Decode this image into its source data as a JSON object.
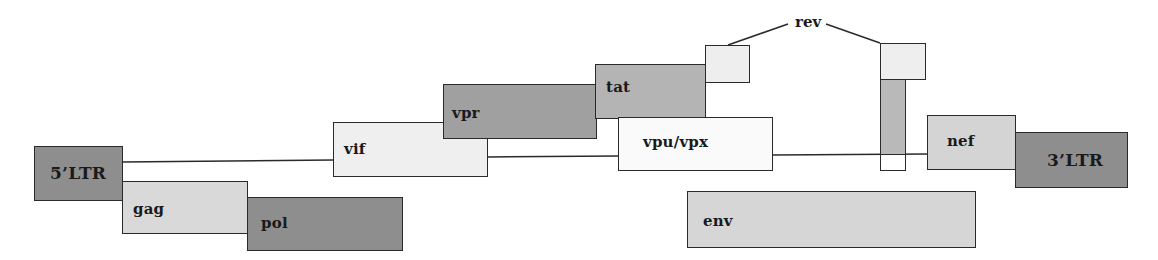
{
  "diagram": {
    "title": "",
    "colors": {
      "dark": "#8e8e8e",
      "medium": "#acacac",
      "light": "#d6d6d6",
      "lighter": "#ececec",
      "white": "#fafafa",
      "stroke": "#2a2a2a"
    },
    "genes": [
      {
        "id": "ltr5",
        "label": "5’LTR",
        "x": 34,
        "y": 146,
        "w": 89,
        "h": 55,
        "fill": "#8e8e8e",
        "label_x": 15,
        "label_y": 16
      },
      {
        "id": "gag",
        "label": "gag",
        "x": 122,
        "y": 181,
        "w": 126,
        "h": 53,
        "fill": "#d9d9d9",
        "label_x": 10,
        "label_y": 18
      },
      {
        "id": "pol",
        "label": "pol",
        "x": 247,
        "y": 197,
        "w": 156,
        "h": 54,
        "fill": "#8e8e8e",
        "label_x": 13,
        "label_y": 16
      },
      {
        "id": "vif",
        "label": "vif",
        "x": 333,
        "y": 122,
        "w": 155,
        "h": 55,
        "fill": "#efefef",
        "label_x": 10,
        "label_y": 17
      },
      {
        "id": "vpr",
        "label": "vpr",
        "x": 443,
        "y": 84,
        "w": 154,
        "h": 55,
        "fill": "#a0a0a0",
        "label_x": 8,
        "label_y": 19
      },
      {
        "id": "tat",
        "label": "tat",
        "x": 595,
        "y": 64,
        "w": 111,
        "h": 55,
        "fill": "#b4b4b4",
        "label_x": 10,
        "label_y": 13
      },
      {
        "id": "rev1",
        "label": "",
        "x": 705,
        "y": 45,
        "w": 45,
        "h": 38,
        "fill": "#eeeeee"
      },
      {
        "id": "vpu",
        "label": "vpu/vpx",
        "x": 618,
        "y": 117,
        "w": 155,
        "h": 54,
        "fill": "#fafafa",
        "label_x": 24,
        "label_y": 15
      },
      {
        "id": "rev2",
        "label": "",
        "x": 880,
        "y": 43,
        "w": 46,
        "h": 37,
        "fill": "#eeeeee"
      },
      {
        "id": "rev2_bar",
        "label": "",
        "x": 880,
        "y": 79,
        "w": 26,
        "h": 76,
        "fill": "#b9b9b9"
      },
      {
        "id": "rev2_tail",
        "label": "",
        "x": 880,
        "y": 154,
        "w": 26,
        "h": 17,
        "fill": "#ffffff"
      },
      {
        "id": "nef",
        "label": "nef",
        "x": 927,
        "y": 115,
        "w": 89,
        "h": 55,
        "fill": "#d4d4d4",
        "label_x": 19,
        "label_y": 16
      },
      {
        "id": "ltr3",
        "label": "3’LTR",
        "x": 1015,
        "y": 132,
        "w": 113,
        "h": 56,
        "fill": "#8e8e8e",
        "label_x": 31,
        "label_y": 17
      },
      {
        "id": "env",
        "label": "env",
        "x": 687,
        "y": 191,
        "w": 289,
        "h": 57,
        "fill": "#d6d6d6",
        "label_x": 15,
        "label_y": 20
      }
    ],
    "connectors": [
      {
        "x1": 122,
        "y1": 162,
        "x2": 333,
        "y2": 160
      },
      {
        "x1": 488,
        "y1": 157,
        "x2": 618,
        "y2": 156
      },
      {
        "x1": 773,
        "y1": 155,
        "x2": 927,
        "y2": 154
      }
    ],
    "rev": {
      "label": "rev",
      "label_x": 795,
      "label_y": 13,
      "leader_lines": [
        {
          "x1": 728,
          "y1": 45,
          "x2": 788,
          "y2": 24
        },
        {
          "x1": 826,
          "y1": 24,
          "x2": 880,
          "y2": 43
        }
      ]
    }
  }
}
